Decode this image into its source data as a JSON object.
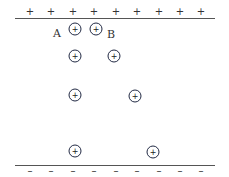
{
  "diagram": {
    "top_plate": {
      "sign": "+",
      "line_y": 18,
      "sign_y": 12,
      "sign_x": [
        30,
        51,
        73,
        94,
        116,
        137,
        159,
        180,
        201
      ]
    },
    "bottom_plate": {
      "sign": "–",
      "line_y": 165,
      "sign_y": 171,
      "sign_x": [
        30,
        51,
        73,
        94,
        116,
        137,
        159,
        180,
        201
      ]
    },
    "charges": [
      {
        "x": 75,
        "y": 29,
        "sign": "+"
      },
      {
        "x": 96,
        "y": 29,
        "sign": "+"
      },
      {
        "x": 75,
        "y": 56,
        "sign": "+"
      },
      {
        "x": 114,
        "y": 56,
        "sign": "+"
      },
      {
        "x": 75,
        "y": 95,
        "sign": "+"
      },
      {
        "x": 135,
        "y": 96,
        "sign": "+"
      },
      {
        "x": 75,
        "y": 151,
        "sign": "+"
      },
      {
        "x": 153,
        "y": 152,
        "sign": "+"
      }
    ],
    "labels": [
      {
        "text": "A",
        "x": 57,
        "y": 33
      },
      {
        "text": "B",
        "x": 111,
        "y": 34
      }
    ]
  }
}
